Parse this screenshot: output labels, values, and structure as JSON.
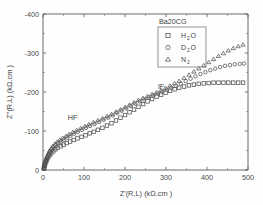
{
  "chart_data": {
    "type": "scatter",
    "title": "Ba20CG",
    "xlabel": "Z'(R,L) (kΩ.cm )",
    "ylabel": "Z''(R,L) (kΩ.cm )",
    "xlim": [
      0,
      500
    ],
    "ylim": [
      0,
      -400
    ],
    "xticks": [
      0,
      100,
      200,
      300,
      400,
      500
    ],
    "yticks": [
      0,
      -100,
      -200,
      -300,
      -400
    ],
    "xtick_labels": [
      "0",
      "100",
      "200",
      "300",
      "400",
      "500"
    ],
    "ytick_labels": [
      "0",
      "-100",
      "-200",
      "-300",
      "-400"
    ],
    "grid": false,
    "legend_position": "top-right",
    "legend_title": "Ba20CG",
    "annotations": [
      {
        "text": "HF",
        "x": 72,
        "y": -128
      },
      {
        "text": "IF",
        "x": 288,
        "y": -207
      }
    ],
    "series": [
      {
        "name": "H2O",
        "label_main": "H",
        "label_sub": "2",
        "label_tail": "O",
        "marker": "square",
        "points": [
          [
            2,
            -3
          ],
          [
            3,
            -7
          ],
          [
            4,
            -11
          ],
          [
            5,
            -15
          ],
          [
            6,
            -19
          ],
          [
            8,
            -23
          ],
          [
            10,
            -28
          ],
          [
            13,
            -33
          ],
          [
            16,
            -38
          ],
          [
            20,
            -43
          ],
          [
            25,
            -48
          ],
          [
            30,
            -53
          ],
          [
            36,
            -57
          ],
          [
            43,
            -61
          ],
          [
            50,
            -65
          ],
          [
            58,
            -69
          ],
          [
            66,
            -73
          ],
          [
            75,
            -77
          ],
          [
            84,
            -81
          ],
          [
            94,
            -85
          ],
          [
            104,
            -89
          ],
          [
            114,
            -94
          ],
          [
            124,
            -98
          ],
          [
            134,
            -103
          ],
          [
            145,
            -108
          ],
          [
            156,
            -114
          ],
          [
            167,
            -120
          ],
          [
            178,
            -127
          ],
          [
            189,
            -134
          ],
          [
            200,
            -141
          ],
          [
            211,
            -148
          ],
          [
            222,
            -155
          ],
          [
            233,
            -162
          ],
          [
            244,
            -169
          ],
          [
            255,
            -176
          ],
          [
            266,
            -182
          ],
          [
            277,
            -188
          ],
          [
            288,
            -193
          ],
          [
            299,
            -198
          ],
          [
            310,
            -203
          ],
          [
            321,
            -207
          ],
          [
            332,
            -211
          ],
          [
            344,
            -214
          ],
          [
            356,
            -217
          ],
          [
            368,
            -219
          ],
          [
            380,
            -221
          ],
          [
            392,
            -222
          ],
          [
            404,
            -223
          ],
          [
            416,
            -224
          ],
          [
            428,
            -224
          ],
          [
            440,
            -224
          ],
          [
            452,
            -224
          ],
          [
            464,
            -224
          ],
          [
            476,
            -224
          ],
          [
            488,
            -224
          ]
        ]
      },
      {
        "name": "D2O",
        "label_main": "D",
        "label_sub": "2",
        "label_tail": "O",
        "marker": "circle",
        "points": [
          [
            2,
            -4
          ],
          [
            3,
            -9
          ],
          [
            4,
            -14
          ],
          [
            5,
            -19
          ],
          [
            7,
            -24
          ],
          [
            9,
            -29
          ],
          [
            11,
            -35
          ],
          [
            14,
            -41
          ],
          [
            17,
            -47
          ],
          [
            21,
            -53
          ],
          [
            26,
            -58
          ],
          [
            31,
            -63
          ],
          [
            37,
            -68
          ],
          [
            44,
            -73
          ],
          [
            51,
            -78
          ],
          [
            59,
            -83
          ],
          [
            67,
            -88
          ],
          [
            76,
            -93
          ],
          [
            85,
            -98
          ],
          [
            95,
            -103
          ],
          [
            105,
            -108
          ],
          [
            115,
            -113
          ],
          [
            126,
            -118
          ],
          [
            137,
            -123
          ],
          [
            148,
            -129
          ],
          [
            159,
            -134
          ],
          [
            170,
            -140
          ],
          [
            181,
            -146
          ],
          [
            192,
            -152
          ],
          [
            203,
            -158
          ],
          [
            214,
            -164
          ],
          [
            225,
            -170
          ],
          [
            236,
            -176
          ],
          [
            247,
            -181
          ],
          [
            258,
            -186
          ],
          [
            269,
            -191
          ],
          [
            280,
            -196
          ],
          [
            291,
            -201
          ],
          [
            302,
            -206
          ],
          [
            313,
            -211
          ],
          [
            324,
            -216
          ],
          [
            336,
            -222
          ],
          [
            348,
            -228
          ],
          [
            360,
            -234
          ],
          [
            372,
            -240
          ],
          [
            384,
            -246
          ],
          [
            396,
            -251
          ],
          [
            408,
            -256
          ],
          [
            420,
            -260
          ],
          [
            432,
            -264
          ],
          [
            444,
            -267
          ],
          [
            456,
            -269
          ],
          [
            468,
            -271
          ],
          [
            480,
            -272
          ],
          [
            490,
            -273
          ]
        ]
      },
      {
        "name": "N2",
        "label_main": "N",
        "label_sub": "2",
        "label_tail": "",
        "marker": "triangle",
        "points": [
          [
            2,
            -5
          ],
          [
            3,
            -11
          ],
          [
            4,
            -17
          ],
          [
            6,
            -23
          ],
          [
            8,
            -29
          ],
          [
            10,
            -35
          ],
          [
            13,
            -42
          ],
          [
            16,
            -49
          ],
          [
            20,
            -55
          ],
          [
            24,
            -61
          ],
          [
            29,
            -67
          ],
          [
            35,
            -72
          ],
          [
            41,
            -77
          ],
          [
            48,
            -82
          ],
          [
            56,
            -87
          ],
          [
            64,
            -92
          ],
          [
            73,
            -97
          ],
          [
            82,
            -102
          ],
          [
            92,
            -107
          ],
          [
            102,
            -112
          ],
          [
            112,
            -117
          ],
          [
            123,
            -122
          ],
          [
            134,
            -127
          ],
          [
            145,
            -132
          ],
          [
            156,
            -138
          ],
          [
            167,
            -143
          ],
          [
            178,
            -149
          ],
          [
            189,
            -155
          ],
          [
            200,
            -161
          ],
          [
            211,
            -167
          ],
          [
            222,
            -173
          ],
          [
            233,
            -179
          ],
          [
            244,
            -184
          ],
          [
            255,
            -189
          ],
          [
            266,
            -194
          ],
          [
            277,
            -199
          ],
          [
            288,
            -204
          ],
          [
            299,
            -210
          ],
          [
            310,
            -216
          ],
          [
            321,
            -222
          ],
          [
            332,
            -228
          ],
          [
            344,
            -236
          ],
          [
            356,
            -244
          ],
          [
            368,
            -252
          ],
          [
            380,
            -260
          ],
          [
            392,
            -268
          ],
          [
            404,
            -276
          ],
          [
            416,
            -284
          ],
          [
            428,
            -292
          ],
          [
            440,
            -299
          ],
          [
            452,
            -306
          ],
          [
            464,
            -312
          ],
          [
            476,
            -317
          ],
          [
            488,
            -321
          ]
        ]
      }
    ]
  }
}
